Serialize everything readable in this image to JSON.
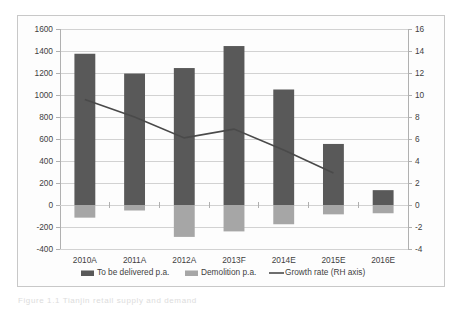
{
  "chart_data": {
    "type": "bar",
    "title": "",
    "subtitle": "",
    "xlabel": "",
    "ylabel": "",
    "categories": [
      "2010A",
      "2011A",
      "2012A",
      "2013F",
      "2014E",
      "2015E",
      "2016E"
    ],
    "series": [
      {
        "name": "To be delivered p.a.",
        "type": "bar",
        "axis": "left",
        "color": "#595959",
        "values": [
          1375,
          1195,
          1245,
          1445,
          1050,
          555,
          135
        ]
      },
      {
        "name": "Demolition p.a.",
        "type": "bar",
        "axis": "left",
        "color": "#a6a6a6",
        "values": [
          -115,
          -50,
          -290,
          -240,
          -175,
          -85,
          -75
        ]
      },
      {
        "name": "Growth rate (RH axis)",
        "type": "line",
        "axis": "right",
        "color": "#4a4a4a",
        "values": [
          9.6,
          8.0,
          6.1,
          6.9,
          5.0,
          2.9,
          null
        ]
      }
    ],
    "left_axis": {
      "min": -400,
      "max": 1600,
      "step": 200,
      "ticks": [
        1600,
        1400,
        1200,
        1000,
        800,
        600,
        400,
        200,
        0,
        -200,
        -400
      ],
      "tick_labels": [
        "1600",
        "1400",
        "1200",
        "1000",
        "800",
        "600",
        "400",
        "200",
        "0",
        "-200",
        "-400"
      ]
    },
    "right_axis": {
      "min": -4,
      "max": 16,
      "step": 2,
      "ticks": [
        16,
        14,
        12,
        10,
        8,
        6,
        4,
        2,
        0,
        -2,
        -4
      ],
      "tick_labels": [
        "16",
        "14",
        "12",
        "10",
        "8",
        "6",
        "4",
        "2",
        "0",
        "-2",
        "-4"
      ]
    },
    "grid": true,
    "legend_position": "bottom",
    "legend": [
      {
        "label": "To be delivered p.a.",
        "marker": "bar",
        "color": "#595959"
      },
      {
        "label": "Demolition p.a.",
        "marker": "bar",
        "color": "#a6a6a6"
      },
      {
        "label": "Growth rate (RH axis)",
        "marker": "line",
        "color": "#4a4a4a"
      }
    ]
  },
  "caption": {
    "text": "Figure 1.1 Tianjin retail supply and demand"
  }
}
